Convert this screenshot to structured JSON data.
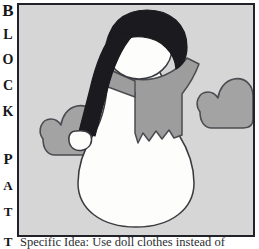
{
  "page": {
    "width": 259,
    "height": 249,
    "background_color": "#ffffff"
  },
  "sidebar": {
    "name": "block-pattern-vertical-label",
    "full_text": "BLOCK PATT",
    "letters": [
      {
        "char": "B",
        "top": 2,
        "size": 17,
        "weight": 700
      },
      {
        "char": "L",
        "top": 28,
        "size": 14,
        "weight": 700
      },
      {
        "char": "O",
        "top": 53,
        "size": 14,
        "weight": 700
      },
      {
        "char": "C",
        "top": 79,
        "size": 14,
        "weight": 700
      },
      {
        "char": "K",
        "top": 105,
        "size": 14,
        "weight": 700
      },
      {
        "char": "P",
        "top": 152,
        "size": 15,
        "weight": 700
      },
      {
        "char": "A",
        "top": 179,
        "size": 13,
        "weight": 700
      },
      {
        "char": "T",
        "top": 205,
        "size": 13,
        "weight": 700
      }
    ]
  },
  "caption": {
    "leading_letter": "T",
    "text": "Specific Idea: Use doll clothes instead of"
  },
  "illustration": {
    "title": "Snowman doll with stocking cap, scarf and hearts",
    "frame_border_color": "#222329",
    "background_color": "#d6d6d6",
    "colors": {
      "snow_white": "#fdfdfb",
      "hat_black": "#1b1b1f",
      "scarf_gray": "#9d9d9d",
      "heart_gray": "#a3a3a3",
      "outline": "#3a3b40"
    },
    "parts": [
      {
        "name": "body",
        "label": "Snowman body",
        "color": "#fdfdfb"
      },
      {
        "name": "head",
        "label": "Snowman head",
        "color": "#fdfdfb"
      },
      {
        "name": "stocking-cap",
        "label": "Black stocking cap",
        "color": "#1b1b1f"
      },
      {
        "name": "cap-pompom",
        "label": "Cap pom-pom",
        "color": "#fdfdfb"
      },
      {
        "name": "scarf",
        "label": "Fringed scarf",
        "color": "#9d9d9d"
      },
      {
        "name": "heart-left",
        "label": "Left heart",
        "color": "#a3a3a3"
      },
      {
        "name": "heart-right",
        "label": "Right heart",
        "color": "#a3a3a3"
      }
    ]
  }
}
